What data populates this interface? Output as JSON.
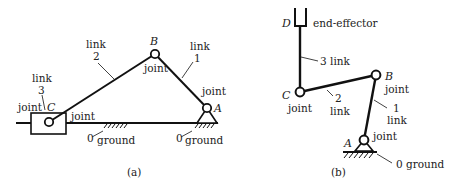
{
  "figure_a": {
    "caption": "(a)",
    "points": {
      "A": "A",
      "B": "B",
      "C": "C"
    },
    "labels": {
      "link1_word": "link",
      "link1_num": "1",
      "link2_word": "link",
      "link2_num": "2",
      "link3_word": "link",
      "link3_num": "3",
      "joint_B": "joint",
      "joint_A": "joint",
      "joint_C_left": "joint",
      "joint_slider": "joint",
      "ground_left_num": "0",
      "ground_left": "ground",
      "ground_right_num": "0",
      "ground_right": "ground"
    }
  },
  "figure_b": {
    "caption": "(b)",
    "points": {
      "A": "A",
      "B": "B",
      "C": "C",
      "D": "D"
    },
    "labels": {
      "end_effector": "end-effector",
      "link3": "3 link",
      "link2_num": "2",
      "link2_word": "link",
      "link1_num": "1",
      "link1_word": "link",
      "joint_B": "joint",
      "joint_C": "joint",
      "joint_A": "joint",
      "ground": "0 ground"
    }
  }
}
